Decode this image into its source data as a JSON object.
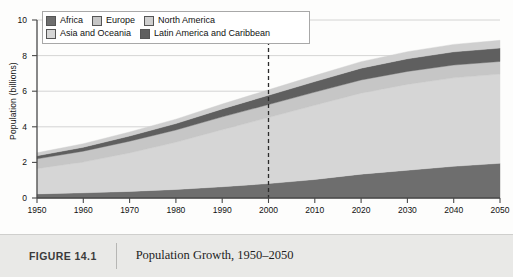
{
  "caption": {
    "figure_number": "FIGURE 14.1",
    "title": "Population Growth, 1950–2050"
  },
  "legend": {
    "rows": [
      [
        {
          "label": "Africa",
          "color": "#6e6e6e"
        },
        {
          "label": "Europe",
          "color": "#c6c6c6"
        },
        {
          "label": "North America",
          "color": "#cfcfcf"
        }
      ],
      [
        {
          "label": "Asia and Oceania",
          "color": "#d6d6d6"
        },
        {
          "label": "Latin America and Caribbean",
          "color": "#5f5f5f"
        }
      ]
    ]
  },
  "chart_data": {
    "type": "area",
    "stacked": true,
    "title": "Population Growth, 1950–2050",
    "xlabel": "",
    "ylabel": "Population (billions)",
    "xlim": [
      1950,
      2050
    ],
    "ylim": [
      0,
      10
    ],
    "yticks": [
      0,
      2,
      4,
      6,
      8,
      10
    ],
    "xticks": [
      1950,
      1960,
      1970,
      1980,
      1990,
      2000,
      2010,
      2020,
      2030,
      2040,
      2050
    ],
    "grid": "horizontal",
    "legend_position": "top-left",
    "annotations": [
      {
        "type": "vertical-dashed-line",
        "x": 2000,
        "label": ""
      }
    ],
    "x": [
      1950,
      1960,
      1970,
      1980,
      1990,
      2000,
      2010,
      2020,
      2030,
      2040,
      2050
    ],
    "series": [
      {
        "name": "Africa",
        "color": "#6e6e6e",
        "values": [
          0.23,
          0.29,
          0.37,
          0.48,
          0.63,
          0.81,
          1.04,
          1.34,
          1.56,
          1.78,
          1.95
        ]
      },
      {
        "name": "Asia and Oceania",
        "color": "#d6d6d6",
        "values": [
          1.42,
          1.73,
          2.16,
          2.65,
          3.21,
          3.71,
          4.17,
          4.55,
          4.82,
          4.97,
          5.01
        ]
      },
      {
        "name": "Europe",
        "color": "#c6c6c6",
        "values": [
          0.55,
          0.61,
          0.66,
          0.69,
          0.72,
          0.73,
          0.74,
          0.74,
          0.73,
          0.72,
          0.71
        ]
      },
      {
        "name": "Latin America and Caribbean",
        "color": "#5f5f5f",
        "values": [
          0.17,
          0.22,
          0.29,
          0.36,
          0.44,
          0.52,
          0.59,
          0.66,
          0.71,
          0.74,
          0.75
        ]
      },
      {
        "name": "North America",
        "color": "#cfcfcf",
        "values": [
          0.17,
          0.2,
          0.23,
          0.25,
          0.28,
          0.31,
          0.34,
          0.37,
          0.4,
          0.42,
          0.44
        ]
      }
    ],
    "totals": [
      2.54,
      3.05,
      3.71,
      4.43,
      5.28,
      6.08,
      6.88,
      7.66,
      8.22,
      8.63,
      8.86
    ]
  }
}
